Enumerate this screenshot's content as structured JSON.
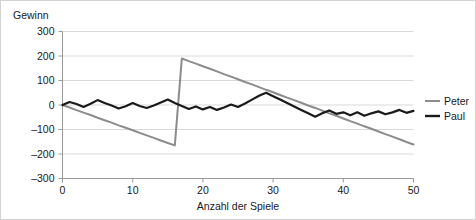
{
  "chart_data": {
    "type": "line",
    "title": "",
    "xlabel": "Anzahl der Spiele",
    "ylabel": "Gewinn",
    "xlim": [
      0,
      50
    ],
    "ylim": [
      -300,
      300
    ],
    "xticks": [
      "0",
      "10",
      "20",
      "30",
      "40",
      "50"
    ],
    "yticks": [
      "300",
      "200",
      "100",
      "0",
      "-100",
      "-200",
      "-300"
    ],
    "grid": "horizontal",
    "legend_position": "right",
    "x": [
      0,
      1,
      2,
      3,
      4,
      5,
      6,
      7,
      8,
      9,
      10,
      11,
      12,
      13,
      14,
      15,
      16,
      17,
      18,
      19,
      20,
      21,
      22,
      23,
      24,
      25,
      26,
      27,
      28,
      29,
      30,
      31,
      32,
      33,
      34,
      35,
      36,
      37,
      38,
      39,
      40,
      41,
      42,
      43,
      44,
      45,
      46,
      47,
      48,
      49,
      50
    ],
    "series": [
      {
        "name": "Peter",
        "color": "#8c8c8c",
        "values": [
          0,
          -10,
          -21,
          -31,
          -41,
          -52,
          -62,
          -72,
          -83,
          -93,
          -103,
          -114,
          -124,
          -134,
          -145,
          -155,
          -165,
          190,
          179,
          169,
          158,
          148,
          137,
          126,
          116,
          105,
          94,
          84,
          73,
          62,
          52,
          41,
          30,
          20,
          9,
          -2,
          -12,
          -23,
          -34,
          -44,
          -55,
          -66,
          -76,
          -87,
          -97,
          -108,
          -119,
          -129,
          -140,
          -151,
          -161
        ]
      },
      {
        "name": "Paul",
        "color": "#1a1a1a",
        "values": [
          0,
          12,
          4,
          -8,
          5,
          20,
          8,
          -2,
          -14,
          -5,
          8,
          -4,
          -12,
          -2,
          10,
          22,
          8,
          -4,
          -16,
          -6,
          -18,
          -8,
          -20,
          -10,
          2,
          -8,
          6,
          22,
          38,
          50,
          36,
          22,
          8,
          -6,
          -20,
          -34,
          -48,
          -34,
          -22,
          -36,
          -30,
          -42,
          -30,
          -44,
          -34,
          -26,
          -38,
          -30,
          -20,
          -32,
          -24
        ]
      }
    ]
  },
  "legend": {
    "items": [
      {
        "label": "Peter"
      },
      {
        "label": "Paul"
      }
    ]
  }
}
